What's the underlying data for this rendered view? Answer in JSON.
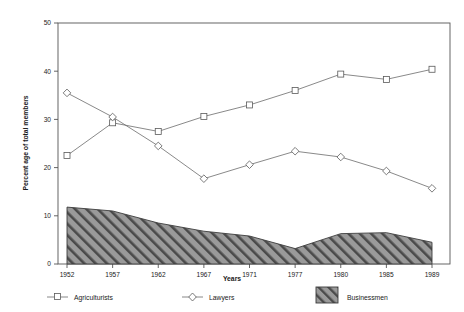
{
  "chart_data": {
    "type": "line",
    "title": "",
    "xlabel": "Years",
    "ylabel": "Percent age of total members",
    "categories": [
      "1952",
      "1957",
      "1962",
      "1967",
      "1971",
      "1977",
      "1980",
      "1985",
      "1989"
    ],
    "ylim": [
      0,
      50
    ],
    "yticks": [
      0,
      10,
      20,
      30,
      40,
      50
    ],
    "ytick_labels": [
      "0",
      "10",
      "20",
      "30",
      "40",
      "50"
    ],
    "grid": false,
    "legend_position": "bottom",
    "series": [
      {
        "name": "Agriculturists",
        "marker": "square",
        "render": "line",
        "values": [
          22.5,
          29.3,
          27.5,
          30.6,
          33.0,
          36.0,
          39.4,
          38.3,
          40.4
        ]
      },
      {
        "name": "Lawyers",
        "marker": "diamond",
        "render": "line",
        "values": [
          35.5,
          30.5,
          24.5,
          17.7,
          20.6,
          23.4,
          22.2,
          19.3,
          15.7
        ]
      },
      {
        "name": "Businessmen",
        "marker": "hatched-area",
        "render": "area",
        "values": [
          11.8,
          11.0,
          8.5,
          6.8,
          5.8,
          3.2,
          6.3,
          6.5,
          4.5
        ]
      }
    ],
    "colors": {
      "line": "#6b6b6b",
      "marker_fill": "#ffffff",
      "marker_stroke": "#5a5a5a",
      "area_fill": "#9a9a9a",
      "area_hatch": "#4a4a4a",
      "axis": "#555555",
      "text": "#1a1a1a"
    }
  },
  "axes": {
    "x_title": "Years",
    "y_title": "Percent age of total members",
    "x_tick_labels": [
      "1952",
      "1957",
      "1962",
      "1967",
      "1971",
      "1977",
      "1980",
      "1985",
      "1989"
    ],
    "y_tick_labels": [
      "0",
      "10",
      "20",
      "30",
      "40",
      "50"
    ]
  },
  "legend": {
    "items": [
      {
        "label": "Agriculturists",
        "swatch": "square-marker-line"
      },
      {
        "label": "Lawyers",
        "swatch": "diamond-marker-line"
      },
      {
        "label": "Businessmen",
        "swatch": "hatched-box"
      }
    ]
  }
}
